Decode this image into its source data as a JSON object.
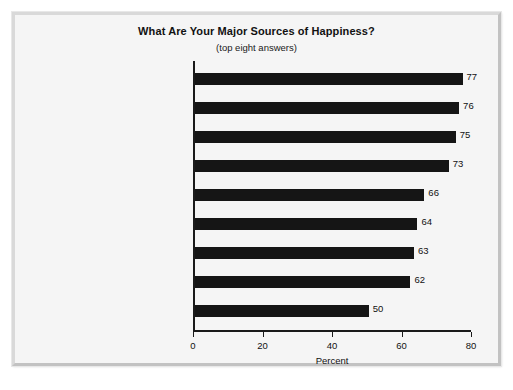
{
  "chart_data": {
    "type": "bar",
    "orientation": "horizontal",
    "title": "What Are Your Major Sources of Happiness?",
    "subtitle": "(top eight answers)",
    "xlabel": "Percent",
    "ylabel": "",
    "xlim": [
      0,
      80
    ],
    "xticks": [
      0,
      20,
      40,
      60,
      80
    ],
    "xtick_labels": [
      "0",
      "20",
      "40",
      "60",
      "80"
    ],
    "grid": false,
    "legend": false,
    "bar_color": "#151515",
    "background_color": "#f5f5f5",
    "categories": [
      "Your relationship\nwith your children",
      "Your friends and\nfriendships",
      "Contributing to the lives\nof others",
      "Your relationships with spouse/\npartner or your love life",
      "Your degree of control over\nyour life and destiny",
      "The things you do in\nyour leisure time",
      "Your relationship with\nyour parents",
      "Your religious or spiritual\nlife and worship",
      "Holiday periods, such as\nChristmas and New Year's"
    ],
    "values": [
      77,
      76,
      75,
      73,
      66,
      64,
      63,
      62,
      50
    ],
    "value_labels": [
      "77",
      "76",
      "75",
      "73",
      "66",
      "64",
      "63",
      "62",
      "50"
    ]
  }
}
